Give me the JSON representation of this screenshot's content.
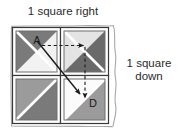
{
  "figure": {
    "title_right": "1 square right",
    "title_down": "1 square\ndown",
    "labels": {
      "start": "A",
      "end": "D"
    },
    "colors": {
      "ink": "#2b2b2b",
      "grid_line": "#3a3a3a",
      "dark_gray": "#7a7a7a",
      "darker_gray": "#6a6a6a",
      "mid_gray": "#9b9b9b",
      "light_gray": "#e6e6e6",
      "very_light_gray": "#f2f2f2",
      "white": "#ffffff",
      "paper": "#ffffff"
    },
    "grid": {
      "rows": 2,
      "cols": 2,
      "cells": [
        {
          "name": "top-left",
          "upper_left_triangle": "dark_gray",
          "lower_right_triangle": "very_light_gray",
          "label": "A"
        },
        {
          "name": "top-right",
          "upper_left_triangle": "light_gray",
          "lower_right_triangle": "darker_gray",
          "label": ""
        },
        {
          "name": "bottom-left",
          "upper_left_triangle": "mid_gray",
          "lower_right_triangle": "dark_gray",
          "label": ""
        },
        {
          "name": "bottom-right",
          "upper_left_triangle": "white",
          "lower_right_triangle": "mid_gray",
          "label": "D"
        }
      ]
    },
    "arrows": {
      "dashed_right": {
        "from": "A",
        "to": "top-right-center",
        "style": "dashed",
        "direction": "right"
      },
      "dashed_down": {
        "from": "top-right-center",
        "to": "D",
        "style": "dashed",
        "direction": "down"
      },
      "solid_diagonal": {
        "from": "A",
        "to": "bottom-right-center",
        "style": "solid",
        "direction": "down-right"
      }
    }
  }
}
